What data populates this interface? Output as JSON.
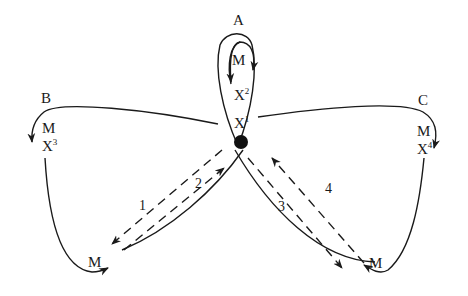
{
  "nodes": {
    "A": {
      "name": "A",
      "m": "M",
      "x": "X",
      "x_sup": "2"
    },
    "B": {
      "name": "B",
      "m": "M",
      "x": "X",
      "x_sup": "3"
    },
    "C": {
      "name": "C",
      "m": "M",
      "x": "X",
      "x_sup": "4"
    },
    "center": {
      "x": "X",
      "x_sup": "1"
    }
  },
  "bottom_left": {
    "m": "M"
  },
  "bottom_right": {
    "m": "M"
  },
  "paths": {
    "p1": "1",
    "p2": "2",
    "p3": "3",
    "p4": "4"
  },
  "colors": {
    "stroke": "#1a1a1a",
    "background": "#ffffff"
  }
}
